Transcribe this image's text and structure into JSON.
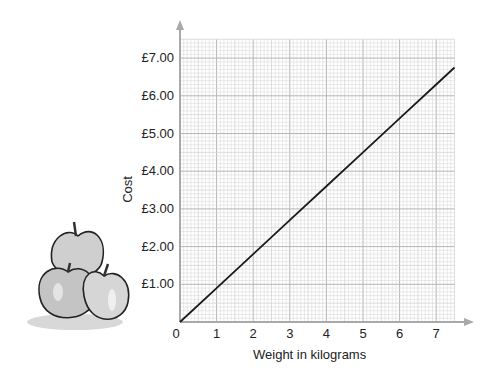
{
  "chart_data": {
    "type": "line",
    "title": "",
    "xlabel": "Weight in kilograms",
    "ylabel": "Cost",
    "x_ticks": [
      "0",
      "1",
      "2",
      "3",
      "4",
      "5",
      "6",
      "7"
    ],
    "y_ticks": [
      "£1.00",
      "£2.00",
      "£3.00",
      "£4.00",
      "£5.00",
      "£6.00",
      "£7.00"
    ],
    "xlim": [
      0,
      7.5
    ],
    "ylim": [
      0,
      7.5
    ],
    "grid": true,
    "grid_minor_step": 0.1,
    "legend": null,
    "series": [
      {
        "name": "Cost of apples",
        "x": [
          0,
          1,
          2,
          3,
          4,
          5,
          6,
          7,
          7.5
        ],
        "y": [
          0,
          0.9,
          1.8,
          2.7,
          3.6,
          4.5,
          5.4,
          6.3,
          6.75
        ]
      }
    ],
    "annotations": [
      "Illustration of three apples beside the y-axis"
    ]
  },
  "colors": {
    "line": "#1a1a1a",
    "axis": "#a9a9a9",
    "grid_minor": "#d4d4d4",
    "grid_major": "#b5b5b5",
    "apple_fill": "#c9c9c9"
  }
}
